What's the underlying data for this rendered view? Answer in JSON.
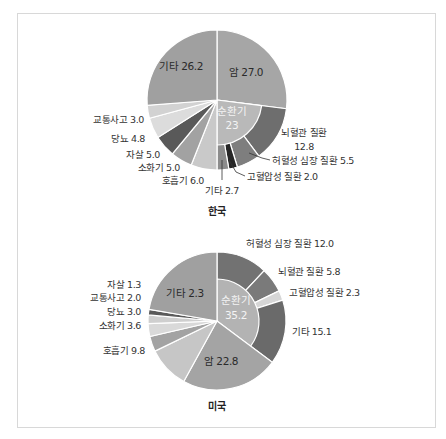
{
  "chart_data": [
    {
      "type": "pie",
      "title": "한국",
      "center": [
        217,
        100
      ],
      "radius": 70,
      "inner_radius": 45,
      "segments": [
        {
          "name": "암",
          "value": 27.0,
          "color": "#a6a6a6",
          "label": "암 27.0"
        },
        {
          "name": "순환기",
          "value": 23,
          "color": "#b9b9b9",
          "label": "순환기",
          "label2": "23",
          "sub": [
            {
              "name": "뇌혈관 질환",
              "value": 12.8,
              "color": "#6e6e6e",
              "label": "뇌혈관 질환",
              "label2": "12.8"
            },
            {
              "name": "허혈성 심장 질환",
              "value": 5.5,
              "color": "#7e7e7e",
              "label": "허혈성 심장 질환 5.5"
            },
            {
              "name": "고혈압성 질환",
              "value": 2.0,
              "color": "#262626",
              "label": "고혈압성 질환 2.0"
            },
            {
              "name": "기타",
              "value": 2.7,
              "color": "#8c8c8c",
              "label": "기타 2.7"
            }
          ]
        },
        {
          "name": "호흡기",
          "value": 6.0,
          "color": "#c9c9c9",
          "label": "호흡기 6.0"
        },
        {
          "name": "소화기",
          "value": 5.0,
          "color": "#a2a2a2",
          "label": "소화기 5.0"
        },
        {
          "name": "자살",
          "value": 5.0,
          "color": "#595959",
          "label": "자살 5.0"
        },
        {
          "name": "당뇨",
          "value": 4.8,
          "color": "#dcdcdc",
          "label": "당뇨 4.8"
        },
        {
          "name": "교통사고",
          "value": 3.0,
          "color": "#d2d2d2",
          "label": "교통사고 3.0"
        },
        {
          "name": "기타",
          "value": 26.2,
          "color": "#a0a0a0",
          "label": "기타 26.2"
        }
      ]
    },
    {
      "type": "pie",
      "title": "미국",
      "center": [
        217,
        321
      ],
      "radius": 69,
      "inner_radius": 42,
      "segments": [
        {
          "name": "순환기",
          "value": 35.2,
          "color": "#b3b3b3",
          "label": "순환기",
          "label2": "35.2",
          "sub": [
            {
              "name": "허혈성 심장 질환",
              "value": 12.0,
              "color": "#727272",
              "label": "허혈성 심장 질환 12.0"
            },
            {
              "name": "뇌혈관 질환",
              "value": 5.8,
              "color": "#7a7a7a",
              "label": "뇌혈관 질환 5.8"
            },
            {
              "name": "고혈압성 질환",
              "value": 2.3,
              "color": "#d6d6d6",
              "label": "고혈압성 질환 2.3"
            },
            {
              "name": "기타",
              "value": 15.1,
              "color": "#6a6a6a",
              "label": "기타 15.1"
            }
          ]
        },
        {
          "name": "암",
          "value": 22.8,
          "color": "#a4a4a4",
          "label": "암 22.8"
        },
        {
          "name": "호흡기",
          "value": 9.8,
          "color": "#c6c6c6",
          "label": "호흡기 9.8"
        },
        {
          "name": "소화기",
          "value": 3.6,
          "color": "#a3a3a3",
          "label": "소화기 3.6"
        },
        {
          "name": "당뇨",
          "value": 3.0,
          "color": "#d9d9d9",
          "label": "당뇨 3.0"
        },
        {
          "name": "교통사고",
          "value": 2.0,
          "color": "#cfcfcf",
          "label": "교통사고 2.0"
        },
        {
          "name": "자살",
          "value": 1.3,
          "color": "#5a5a5a",
          "label": "자살 1.3"
        },
        {
          "name": "기타",
          "value": 22.3,
          "color": "#a0a0a0",
          "label": "기타 2.3"
        }
      ]
    }
  ],
  "charts": {
    "korea": {
      "title": "한국",
      "labels": {
        "cancer": "암 27.0",
        "circ_1": "순환기",
        "circ_2": "23",
        "cerebro_1": "뇌혈관 질환",
        "cerebro_2": "12.8",
        "ischemic": "허혈성 심장 질환 5.5",
        "hypertensive": "고혈압성 질환 2.0",
        "circ_other": "기타 2.7",
        "respiratory": "호흡기 6.0",
        "digestive": "소화기 5.0",
        "suicide": "자살 5.0",
        "diabetes": "당뇨 4.8",
        "traffic": "교통사고 3.0",
        "other": "기타 26.2"
      }
    },
    "usa": {
      "title": "미국",
      "labels": {
        "circ_1": "순환기",
        "circ_2": "35.2",
        "ischemic": "허혈성 심장 질환 12.0",
        "cerebro": "뇌혈관 질환 5.8",
        "hypertensive": "고혈압성 질환 2.3",
        "circ_other": "기타 15.1",
        "cancer": "암 22.8",
        "respiratory": "호흡기 9.8",
        "digestive": "소화기 3.6",
        "diabetes": "당뇨 3.0",
        "traffic": "교통사고 2.0",
        "suicide": "자살 1.3",
        "other": "기타 2.3"
      }
    }
  }
}
